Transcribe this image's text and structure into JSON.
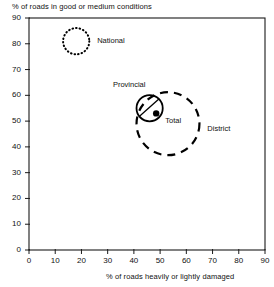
{
  "chart_data": {
    "type": "scatter",
    "title": "",
    "xlabel": "%  of roads heavily or lightly damaged",
    "ylabel": "%  of roads  in  good or medium conditions",
    "xlim": [
      0,
      90
    ],
    "ylim": [
      0,
      90
    ],
    "xticks": [
      0,
      10,
      20,
      30,
      40,
      50,
      60,
      70,
      80,
      90
    ],
    "yticks": [
      0,
      10,
      20,
      30,
      40,
      50,
      60,
      70,
      80,
      90
    ],
    "grid": false,
    "legend": "inline-annotations",
    "series": [
      {
        "name": "National",
        "label": "National",
        "marker": "dotted-circle",
        "x": 18,
        "y": 81,
        "radius": 5,
        "label_x": 26,
        "label_y": 81
      },
      {
        "name": "Provincial",
        "label": "Provincial",
        "marker": "solid-circle",
        "x": 46,
        "y": 55,
        "radius": 5,
        "label_x": 32,
        "label_y": 64,
        "leader_to_x": 48,
        "leader_to_y": 57
      },
      {
        "name": "District",
        "label": "District",
        "marker": "dashed-circle",
        "x": 53,
        "y": 49,
        "radius": 12,
        "label_x": 68,
        "label_y": 47
      },
      {
        "name": "Total",
        "label": "Total",
        "marker": "filled-dot",
        "x": 48.5,
        "y": 53,
        "radius": 0,
        "label_x": 52,
        "label_y": 50
      }
    ],
    "colors": {
      "axis": "#1a1a1a",
      "marker": "#000000",
      "text": "#111111",
      "background": "#ffffff"
    }
  }
}
